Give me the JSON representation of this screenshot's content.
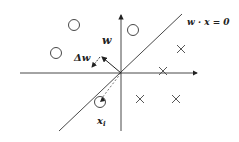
{
  "diagram": {
    "labels": {
      "weight_vector": "w",
      "weight_update": "Δw",
      "decision_boundary": "w · x = 0",
      "sample_point": "x",
      "sample_subscript": "i"
    },
    "colors": {
      "stroke": "#333333",
      "background": "#ffffff"
    },
    "class_circles": [
      {
        "x": 74,
        "y": 25
      },
      {
        "x": 56,
        "y": 53
      },
      {
        "x": 133,
        "y": 30
      },
      {
        "x": 100,
        "y": 102
      }
    ],
    "class_crosses": [
      {
        "x": 181,
        "y": 49
      },
      {
        "x": 163,
        "y": 71
      },
      {
        "x": 140,
        "y": 99
      },
      {
        "x": 176,
        "y": 99
      }
    ]
  }
}
